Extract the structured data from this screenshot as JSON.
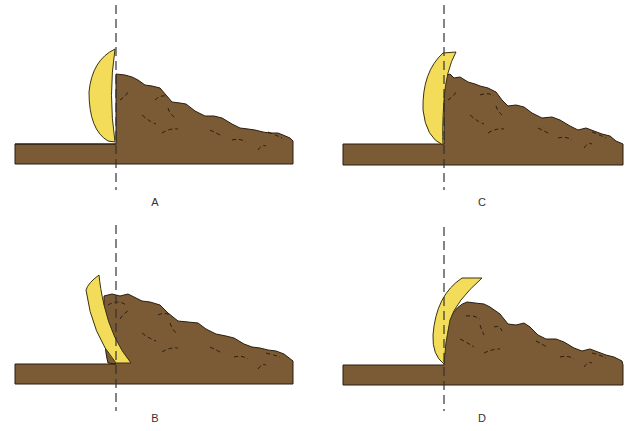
{
  "diagram": {
    "colors": {
      "soil": "#7a5b36",
      "soil_outline": "#2a1d10",
      "blade": "#f3dc5a",
      "blade_outline": "#3a3210",
      "reference_line": "#333333",
      "background": "#ffffff"
    },
    "panels": [
      {
        "id": "A",
        "label": "A",
        "blade_pose": "upright, curved face toward soil, tip at reference line"
      },
      {
        "id": "B",
        "label": "B",
        "blade_pose": "tilted back, bottom edge past reference line"
      },
      {
        "id": "C",
        "label": "C",
        "blade_pose": "upright, top edge past reference line"
      },
      {
        "id": "D",
        "label": "D",
        "blade_pose": "tilted forward over soil"
      }
    ]
  }
}
